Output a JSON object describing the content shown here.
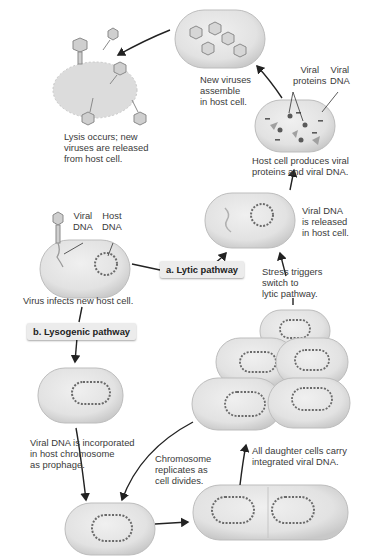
{
  "diagram": {
    "colors": {
      "cell_fill": "#e4e4e4",
      "cell_edge": "#bdbdbd",
      "dna": "#6a6a6a",
      "arrow": "#222222",
      "label_text": "#3a3a3a",
      "pathway_label_bg": "#ececec"
    },
    "pathway_labels": {
      "lytic": "a. Lytic pathway",
      "lysogenic": "b. Lysogenic pathway"
    },
    "steps": {
      "infect": "Virus infects new host cell.",
      "infect_viral_dna": "Viral\nDNA",
      "infect_host_dna": "Host\nDNA",
      "released": "Viral DNA\nis released\nin host cell.",
      "produces": "Host cell produces viral\nproteins and viral DNA.",
      "produces_viral_proteins": "Viral\nproteins",
      "produces_viral_dna": "Viral\nDNA",
      "assemble": "New viruses\nassemble\nin host cell.",
      "lysis": "Lysis occurs; new\nviruses are released\nfrom host cell.",
      "stress": "Stress triggers\nswitch to\nlytic pathway.",
      "prophage": "Viral DNA is incorporated\nin host chromosome\nas prophage.",
      "replicates": "Chromosome\nreplicates as\ncell divides.",
      "daughters": "All daughter cells carry\nintegrated viral DNA."
    }
  }
}
